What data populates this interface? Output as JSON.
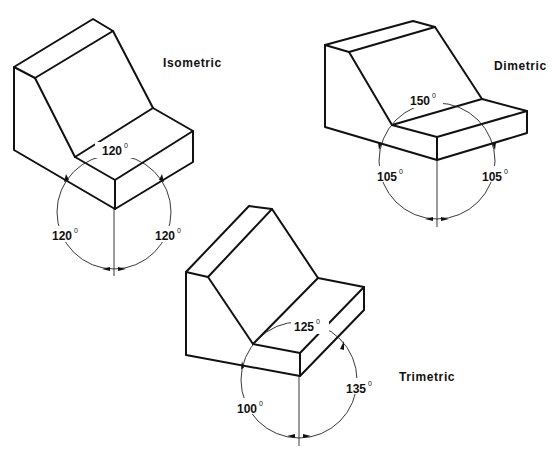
{
  "figure": {
    "views": [
      {
        "name": "Isometric",
        "label": "Isometric",
        "angles": {
          "top": "120",
          "left": "120",
          "right": "120"
        },
        "degree_symbol": "0"
      },
      {
        "name": "Dimetric",
        "label": "Dimetric",
        "angles": {
          "top": "150",
          "left": "105",
          "right": "105"
        },
        "degree_symbol": "0"
      },
      {
        "name": "Trimetric",
        "label": "Trimetric",
        "angles": {
          "top": "125",
          "left": "100",
          "right": "135"
        },
        "degree_symbol": "0"
      }
    ],
    "colors": {
      "line": "#111111",
      "background": "#ffffff"
    }
  }
}
